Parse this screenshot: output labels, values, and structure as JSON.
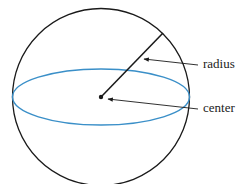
{
  "diagram": {
    "type": "sphere",
    "labels": {
      "radius": "radius",
      "center": "center"
    },
    "colors": {
      "outline": "#1a1a1a",
      "equator": "#3a8fc8",
      "text": "#222222"
    }
  }
}
